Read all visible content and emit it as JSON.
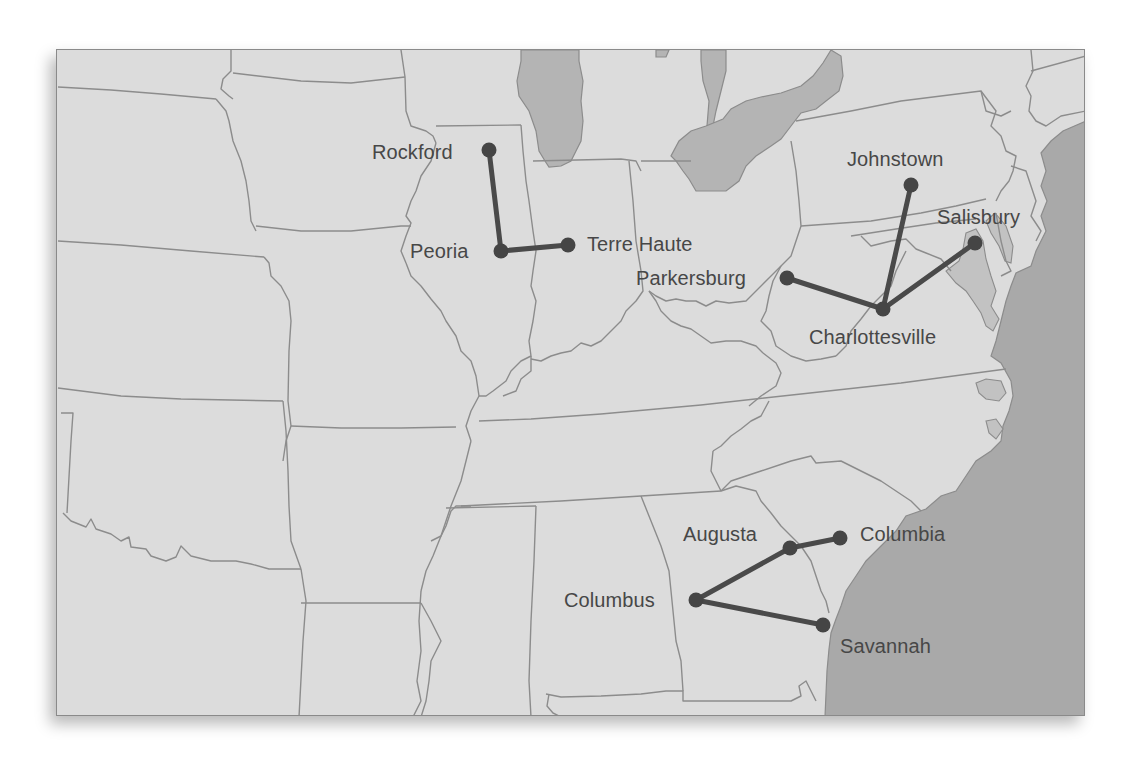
{
  "map": {
    "title": "",
    "colors": {
      "land": "#dcdcdc",
      "water": "#a9a9a9",
      "lakes": "#b4b4b4",
      "borders": "#8c8c8c",
      "routes": "#4a4a4a",
      "labels": "#474747"
    },
    "cities": {
      "rockford": {
        "label": "Rockford",
        "x": 488,
        "y": 149
      },
      "peoria": {
        "label": "Peoria",
        "x": 500,
        "y": 250
      },
      "terre_haute": {
        "label": "Terre Haute",
        "x": 567,
        "y": 244
      },
      "johnstown": {
        "label": "Johnstown",
        "x": 910,
        "y": 184
      },
      "salisbury": {
        "label": "Salisbury",
        "x": 974,
        "y": 242
      },
      "parkersburg": {
        "label": "Parkersburg",
        "x": 786,
        "y": 277
      },
      "charlottesville": {
        "label": "Charlottesville",
        "x": 882,
        "y": 308
      },
      "augusta": {
        "label": "Augusta",
        "x": 789,
        "y": 547
      },
      "columbia": {
        "label": "Columbia",
        "x": 839,
        "y": 537
      },
      "columbus": {
        "label": "Columbus",
        "x": 695,
        "y": 599
      },
      "savannah": {
        "label": "Savannah",
        "x": 822,
        "y": 624
      }
    },
    "routes": [
      {
        "from": "rockford",
        "to": "peoria"
      },
      {
        "from": "peoria",
        "to": "terre_haute"
      },
      {
        "from": "parkersburg",
        "to": "charlottesville"
      },
      {
        "from": "johnstown",
        "to": "charlottesville"
      },
      {
        "from": "salisbury",
        "to": "charlottesville"
      },
      {
        "from": "columbus",
        "to": "augusta"
      },
      {
        "from": "augusta",
        "to": "columbia"
      },
      {
        "from": "columbus",
        "to": "savannah"
      }
    ],
    "clusters": [
      {
        "name": "Illinois-Indiana",
        "hub": "Peoria",
        "spokes": [
          "Rockford",
          "Terre Haute"
        ]
      },
      {
        "name": "Virginia",
        "hub": "Charlottesville",
        "spokes": [
          "Parkersburg",
          "Johnstown",
          "Salisbury"
        ]
      },
      {
        "name": "Georgia-Carolina",
        "hub": "Columbus",
        "spokes": [
          "Augusta",
          "Savannah"
        ],
        "chain": [
          "Augusta",
          "Columbia"
        ]
      }
    ]
  }
}
